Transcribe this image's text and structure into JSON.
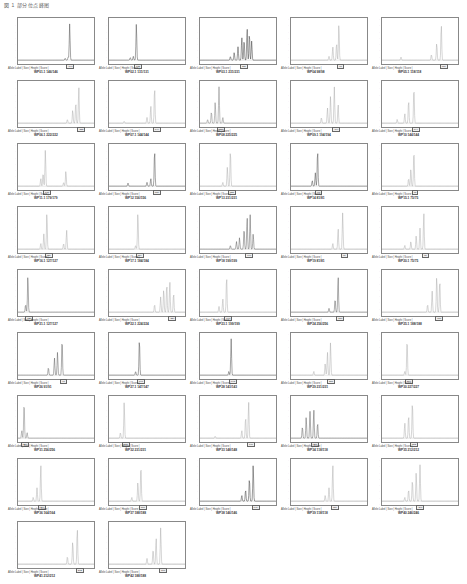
{
  "caption": "図 1 部分位点峰图",
  "panel_meta": "Allele Label | Size | Height | Score |",
  "panels": [
    {
      "name": "WP01.1 146/146",
      "trace": "#444",
      "peaks": [
        [
          0.62,
          0.05
        ],
        [
          0.66,
          0.08
        ],
        [
          0.68,
          0.95
        ]
      ],
      "allele": 0.66
    },
    {
      "name": "WP02.1 131/131",
      "trace": "#444",
      "peaks": [
        [
          0.28,
          0.07
        ],
        [
          0.32,
          0.1
        ],
        [
          0.36,
          0.95
        ]
      ],
      "allele": 0.36
    },
    {
      "name": "WP03.1 231/231",
      "trace": "#333",
      "peaks": [
        [
          0.4,
          0.1
        ],
        [
          0.45,
          0.2
        ],
        [
          0.5,
          0.35
        ],
        [
          0.55,
          0.6
        ],
        [
          0.58,
          0.55
        ],
        [
          0.62,
          0.85
        ],
        [
          0.65,
          0.7
        ],
        [
          0.68,
          0.5
        ]
      ],
      "allele": 0.55
    },
    {
      "name": "WP04 98/98",
      "trace": "#aaa",
      "peaks": [
        [
          0.5,
          0.1
        ],
        [
          0.55,
          0.35
        ],
        [
          0.6,
          0.45
        ],
        [
          0.63,
          0.95
        ]
      ],
      "allele": 0.63
    },
    {
      "name": "WP05.1 118/118",
      "trace": "#aaa",
      "peaks": [
        [
          0.25,
          0.08
        ],
        [
          0.65,
          0.15
        ],
        [
          0.72,
          0.45
        ],
        [
          0.78,
          0.95
        ]
      ],
      "allele": 0.78
    },
    {
      "name": "WP06.1 222/222",
      "trace": "#aaa",
      "peaks": [
        [
          0.65,
          0.1
        ],
        [
          0.72,
          0.35
        ],
        [
          0.76,
          0.55
        ],
        [
          0.8,
          0.95
        ]
      ],
      "allele": 0.8
    },
    {
      "name": "WP07.1 144/144",
      "trace": "#aaa",
      "peaks": [
        [
          0.2,
          0.05
        ],
        [
          0.5,
          0.15
        ],
        [
          0.55,
          0.45
        ],
        [
          0.6,
          0.95
        ]
      ],
      "allele": 0.6
    },
    {
      "name": "WP08 225/225",
      "trace": "#777",
      "peaks": [
        [
          0.1,
          0.1
        ],
        [
          0.15,
          0.3
        ],
        [
          0.2,
          0.55
        ],
        [
          0.25,
          0.95
        ],
        [
          0.3,
          0.15
        ]
      ],
      "allele": 0.25
    },
    {
      "name": "WP09.1 194/194",
      "trace": "#aaa",
      "peaks": [
        [
          0.4,
          0.15
        ],
        [
          0.48,
          0.4
        ],
        [
          0.52,
          0.7
        ],
        [
          0.57,
          0.95
        ],
        [
          0.62,
          0.5
        ]
      ],
      "allele": 0.57
    },
    {
      "name": "WP10 144/144",
      "trace": "#aaa",
      "peaks": [
        [
          0.2,
          0.1
        ],
        [
          0.3,
          0.25
        ],
        [
          0.35,
          0.6
        ],
        [
          0.42,
          0.95
        ]
      ],
      "allele": 0.42
    },
    {
      "name": "WP11.1 179/179",
      "trace": "#aaa",
      "peaks": [
        [
          0.3,
          0.2
        ],
        [
          0.33,
          0.35
        ],
        [
          0.36,
          0.95
        ],
        [
          0.6,
          0.1
        ],
        [
          0.63,
          0.4
        ]
      ],
      "allele": 0.36
    },
    {
      "name": "WP12 156/156",
      "trace": "#444",
      "peaks": [
        [
          0.25,
          0.08
        ],
        [
          0.5,
          0.1
        ],
        [
          0.55,
          0.2
        ],
        [
          0.6,
          0.95
        ]
      ],
      "allele": 0.6
    },
    {
      "name": "WP13 231/231",
      "trace": "#aaa",
      "peaks": [
        [
          0.3,
          0.1
        ],
        [
          0.36,
          0.5
        ],
        [
          0.4,
          0.95
        ]
      ],
      "allele": 0.4
    },
    {
      "name": "WP14 81/81",
      "trace": "#444",
      "peaks": [
        [
          0.28,
          0.15
        ],
        [
          0.32,
          0.35
        ],
        [
          0.35,
          0.95
        ]
      ],
      "allele": 0.35
    },
    {
      "name": "WP15.1 75/75",
      "trace": "#aaa",
      "peaks": [
        [
          0.35,
          0.2
        ],
        [
          0.38,
          0.45
        ],
        [
          0.42,
          0.95
        ]
      ],
      "allele": 0.42
    },
    {
      "name": "WP16.1 127/127",
      "trace": "#aaa",
      "peaks": [
        [
          0.3,
          0.15
        ],
        [
          0.34,
          0.4
        ],
        [
          0.38,
          0.95
        ],
        [
          0.6,
          0.15
        ],
        [
          0.64,
          0.5
        ]
      ],
      "allele": 0.38
    },
    {
      "name": "WP17.1 184/184",
      "trace": "#aaa",
      "peaks": [
        [
          0.35,
          0.1
        ],
        [
          0.38,
          0.95
        ]
      ],
      "allele": 0.38
    },
    {
      "name": "WP18 199/199",
      "trace": "#555",
      "peaks": [
        [
          0.4,
          0.1
        ],
        [
          0.48,
          0.2
        ],
        [
          0.52,
          0.3
        ],
        [
          0.58,
          0.55
        ],
        [
          0.62,
          0.85
        ],
        [
          0.66,
          0.9
        ],
        [
          0.7,
          0.4
        ]
      ],
      "allele": 0.62
    },
    {
      "name": "WP19 81/81",
      "trace": "#aaa",
      "peaks": [
        [
          0.55,
          0.15
        ],
        [
          0.62,
          0.55
        ],
        [
          0.68,
          0.95
        ]
      ],
      "allele": 0.68
    },
    {
      "name": "WP20.1 75/75",
      "trace": "#aaa",
      "peaks": [
        [
          0.3,
          0.1
        ],
        [
          0.38,
          0.2
        ],
        [
          0.45,
          0.35
        ],
        [
          0.5,
          0.55
        ],
        [
          0.55,
          0.95
        ]
      ],
      "allele": 0.55
    },
    {
      "name": "WP21.1 127/127",
      "trace": "#555",
      "peaks": [
        [
          0.1,
          0.2
        ],
        [
          0.13,
          0.95
        ]
      ],
      "allele": 0.13
    },
    {
      "name": "WP22.1 224/224",
      "trace": "#aaa",
      "peaks": [
        [
          0.6,
          0.2
        ],
        [
          0.68,
          0.4
        ],
        [
          0.72,
          0.6
        ],
        [
          0.76,
          0.75
        ],
        [
          0.8,
          0.8
        ],
        [
          0.85,
          0.5
        ]
      ],
      "allele": 0.8
    },
    {
      "name": "WP23.1 199/199",
      "trace": "#aaa",
      "peaks": [
        [
          0.25,
          0.15
        ],
        [
          0.3,
          0.35
        ],
        [
          0.35,
          0.95
        ]
      ],
      "allele": 0.35
    },
    {
      "name": "WP24 256/256",
      "trace": "#555",
      "peaks": [
        [
          0.5,
          0.1
        ],
        [
          0.58,
          0.35
        ],
        [
          0.62,
          0.95
        ]
      ],
      "allele": 0.62
    },
    {
      "name": "WP25.1 188/188",
      "trace": "#aaa",
      "peaks": [
        [
          0.6,
          0.2
        ],
        [
          0.66,
          0.55
        ],
        [
          0.72,
          0.95
        ],
        [
          0.76,
          0.85
        ]
      ],
      "allele": 0.72
    },
    {
      "name": "WP26 91/91",
      "trace": "#555",
      "peaks": [
        [
          0.4,
          0.2
        ],
        [
          0.48,
          0.45
        ],
        [
          0.52,
          0.6
        ],
        [
          0.58,
          0.95
        ]
      ],
      "allele": 0.58
    },
    {
      "name": "WP27.1 147/147",
      "trace": "#444",
      "peaks": [
        [
          0.35,
          0.1
        ],
        [
          0.4,
          0.95
        ]
      ],
      "allele": 0.4
    },
    {
      "name": "WP28 143/143",
      "trace": "#444",
      "peaks": [
        [
          0.38,
          0.1
        ],
        [
          0.41,
          0.95
        ]
      ],
      "allele": 0.41
    },
    {
      "name": "WP29 231/231",
      "trace": "#aaa",
      "peaks": [
        [
          0.3,
          0.1
        ],
        [
          0.45,
          0.3
        ],
        [
          0.48,
          0.6
        ],
        [
          0.52,
          0.85
        ]
      ],
      "allele": 0.5
    },
    {
      "name": "WP30 227/227",
      "trace": "#aaa",
      "peaks": [
        [
          0.3,
          0.1
        ],
        [
          0.33,
          0.95
        ]
      ],
      "allele": 0.33
    },
    {
      "name": "WP31 256/256",
      "trace": "#777",
      "peaks": [
        [
          0.05,
          0.2
        ],
        [
          0.08,
          0.95
        ],
        [
          0.12,
          0.15
        ]
      ],
      "allele": 0.08
    },
    {
      "name": "WP32 231/231",
      "trace": "#aaa",
      "peaks": [
        [
          0.15,
          0.15
        ],
        [
          0.2,
          0.95
        ]
      ],
      "allele": 0.2
    },
    {
      "name": "WP33 148/148",
      "trace": "#aaa",
      "peaks": [
        [
          0.2,
          0.05
        ],
        [
          0.55,
          0.2
        ],
        [
          0.6,
          0.55
        ],
        [
          0.64,
          0.95
        ]
      ],
      "allele": 0.64
    },
    {
      "name": "WP34 118/118",
      "trace": "#555",
      "peaks": [
        [
          0.15,
          0.3
        ],
        [
          0.2,
          0.55
        ],
        [
          0.25,
          0.7
        ],
        [
          0.3,
          0.75
        ],
        [
          0.35,
          0.4
        ]
      ],
      "allele": 0.3
    },
    {
      "name": "WP35 212/212",
      "trace": "#aaa",
      "peaks": [
        [
          0.3,
          0.4
        ],
        [
          0.35,
          0.6
        ],
        [
          0.4,
          0.95
        ]
      ],
      "allele": 0.4
    },
    {
      "name": "WP36 164/164",
      "trace": "#aaa",
      "peaks": [
        [
          0.2,
          0.1
        ],
        [
          0.25,
          0.35
        ],
        [
          0.3,
          0.95
        ]
      ],
      "allele": 0.3
    },
    {
      "name": "WP37 188/188",
      "trace": "#aaa",
      "peaks": [
        [
          0.3,
          0.1
        ],
        [
          0.38,
          0.5
        ],
        [
          0.42,
          0.95
        ]
      ],
      "allele": 0.42
    },
    {
      "name": "WP38 146/146",
      "trace": "#333",
      "peaks": [
        [
          0.55,
          0.15
        ],
        [
          0.6,
          0.3
        ],
        [
          0.65,
          0.6
        ],
        [
          0.7,
          0.95
        ]
      ],
      "allele": 0.7
    },
    {
      "name": "WP39 118/118",
      "trace": "#aaa",
      "peaks": [
        [
          0.45,
          0.15
        ],
        [
          0.5,
          0.35
        ],
        [
          0.55,
          0.95
        ]
      ],
      "allele": 0.55
    },
    {
      "name": "WP40 246/246",
      "trace": "#aaa",
      "peaks": [
        [
          0.3,
          0.1
        ],
        [
          0.35,
          0.3
        ],
        [
          0.4,
          0.55
        ],
        [
          0.45,
          0.75
        ],
        [
          0.5,
          0.95
        ]
      ],
      "allele": 0.48
    },
    {
      "name": "WP41 212/212",
      "trace": "#aaa",
      "peaks": [
        [
          0.65,
          0.2
        ],
        [
          0.72,
          0.6
        ],
        [
          0.78,
          0.95
        ]
      ],
      "allele": 0.78
    },
    {
      "name": "WP42 188/188",
      "trace": "#aaa",
      "peaks": [
        [
          0.5,
          0.15
        ],
        [
          0.58,
          0.4
        ],
        [
          0.62,
          0.7
        ],
        [
          0.68,
          0.95
        ]
      ],
      "allele": 0.68
    }
  ],
  "chart_data": {
    "type": "line",
    "layout": "grid 5 columns x 9 rows",
    "xlabel": "Fragment size (bp)",
    "ylabel": "RFU",
    "series_names": [
      "WP01.1 146/146",
      "WP02.1 131/131",
      "WP03.1 231/231",
      "WP04 98/98",
      "WP05.1 118/118",
      "WP06.1 222/222",
      "WP07.1 144/144",
      "WP08 225/225",
      "WP09.1 194/194",
      "WP10 144/144",
      "WP11.1 179/179",
      "WP12 156/156",
      "WP13 231/231",
      "WP14 81/81",
      "WP15.1 75/75",
      "WP16.1 127/127",
      "WP17.1 184/184",
      "WP18 199/199",
      "WP19 81/81",
      "WP20.1 75/75",
      "WP21.1 127/127",
      "WP22.1 224/224",
      "WP23.1 199/199",
      "WP24 256/256",
      "WP25.1 188/188",
      "WP26 91/91",
      "WP27.1 147/147",
      "WP28 143/143",
      "WP29 231/231",
      "WP30 227/227",
      "WP31 256/256",
      "WP32 231/231",
      "WP33 148/148",
      "WP34 118/118",
      "WP35 212/212",
      "WP36 164/164",
      "WP37 188/188",
      "WP38 146/146",
      "WP39 118/118",
      "WP40 246/246",
      "WP41 212/212",
      "WP42 188/188"
    ]
  }
}
